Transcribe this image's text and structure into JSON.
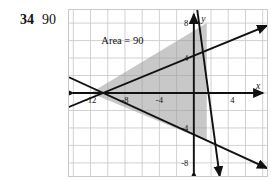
{
  "problem": {
    "number": "34",
    "answer": "90",
    "bleed_text": "· · · · · · · · · · · · · · ·"
  },
  "figure": {
    "annotation": "Area = 90",
    "axis_labels": {
      "x": "x",
      "y": "y"
    },
    "x_ticks": [
      "-12",
      "-8",
      "-4",
      "4"
    ],
    "y_ticks": [
      "8",
      "4",
      "-4",
      "-8"
    ],
    "colors": {
      "grid": "#c6c6cc",
      "grid_major": "#b0b0b8",
      "axis": "#111111",
      "line": "#111111",
      "fill": "#9a9a9a",
      "border": "#c9c9c9",
      "text": "#111111"
    }
  },
  "chart_data": {
    "type": "line",
    "title": "Area = 90",
    "xlabel": "x",
    "ylabel": "y",
    "xlim": [
      -14.5,
      8.5
    ],
    "ylim": [
      -9.5,
      9.5
    ],
    "grid": true,
    "legend": "none",
    "x_tick_values": [
      -12,
      -8,
      -4,
      4
    ],
    "y_tick_values": [
      8,
      4,
      -4,
      -8
    ],
    "shaded_region": {
      "label": "Area = 90",
      "area": 90,
      "vertices": [
        [
          -12,
          0
        ],
        [
          1.5,
          8
        ],
        [
          1.5,
          -5.5
        ]
      ]
    },
    "series": [
      {
        "name": "line-1",
        "points": [
          [
            -14.5,
            -1.6
          ],
          [
            8.5,
            7.7
          ]
        ]
      },
      {
        "name": "line-2",
        "points": [
          [
            -14.5,
            1.8
          ],
          [
            8.5,
            -8.6
          ]
        ]
      },
      {
        "name": "line-3",
        "points": [
          [
            0.4,
            9.5
          ],
          [
            3.0,
            -9.5
          ]
        ]
      }
    ]
  }
}
